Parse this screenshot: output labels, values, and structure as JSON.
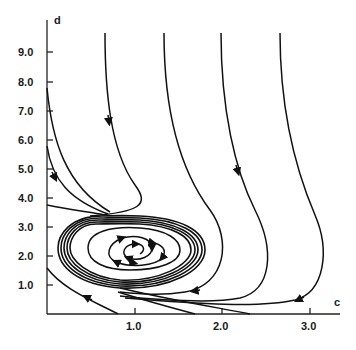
{
  "figure": {
    "type": "phase-portrait",
    "colors": {
      "background": "#ffffff",
      "ink": "#111111"
    }
  },
  "axes": {
    "x": {
      "label": "c",
      "ticks": [
        "1.0",
        "2.0",
        "3.0"
      ]
    },
    "y": {
      "label": "d",
      "ticks": [
        "1.0",
        "2.0",
        "3.0",
        "4.0",
        "5.0",
        "6.0",
        "7.0",
        "8.0",
        "9.0"
      ]
    }
  },
  "features": {
    "limit_cycle": "stable limit cycle centered near c≈1.0, d≈2.2",
    "focus": "unstable spiral near c≈1.1, d≈2.2",
    "trajectories_from_top": 4,
    "trajectories_from_left_axis": 3,
    "trajectory_from_bottom_left": 1
  }
}
